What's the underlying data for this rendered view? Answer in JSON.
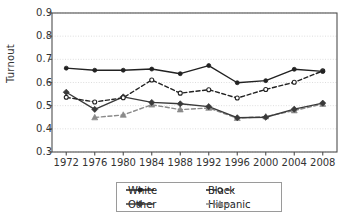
{
  "chart_data": {
    "type": "line",
    "title": "",
    "xlabel": "",
    "ylabel": "Turnout",
    "x": [
      1972,
      1976,
      1980,
      1984,
      1988,
      1992,
      1996,
      2000,
      2004,
      2008
    ],
    "xtick_labels": [
      "1972",
      "1976",
      "1980",
      "1984",
      "1988",
      "1992",
      "1996",
      "2000",
      "2004",
      "2008"
    ],
    "ytick_labels": [
      "0.9",
      "0.8",
      "0.7",
      "0.6",
      "0.5",
      "0.4",
      "0.3"
    ],
    "ytick_values": [
      0.9,
      0.8,
      0.7,
      0.6,
      0.5,
      0.4,
      0.3
    ],
    "ylim": [
      0.3,
      0.9
    ],
    "xlim": [
      1970,
      2010
    ],
    "grid": true,
    "legend_position": "below-center",
    "series": [
      {
        "name": "White",
        "marker": "filled-circle",
        "line_style": "solid",
        "color": "#222222",
        "values": [
          0.662,
          0.653,
          0.653,
          0.658,
          0.638,
          0.673,
          0.599,
          0.608,
          0.657,
          0.648
        ]
      },
      {
        "name": "Black",
        "marker": "open-circle",
        "line_style": "dashed",
        "color": "#222222",
        "values": [
          0.536,
          0.516,
          0.534,
          0.611,
          0.554,
          0.569,
          0.533,
          0.57,
          0.601,
          0.65
        ]
      },
      {
        "name": "Other",
        "marker": "filled-diamond",
        "line_style": "solid",
        "color": "#3a3a3a",
        "values": [
          0.558,
          0.484,
          0.538,
          0.514,
          0.508,
          0.496,
          0.448,
          0.45,
          0.485,
          0.511
        ]
      },
      {
        "name": "Hispanic",
        "marker": "filled-triangle",
        "line_style": "dashed",
        "color": "#8a8a8a",
        "values": [
          null,
          0.449,
          0.46,
          0.504,
          0.483,
          0.49,
          0.446,
          0.453,
          0.479,
          0.507
        ]
      }
    ]
  },
  "legend": {
    "entries": [
      {
        "label": "White"
      },
      {
        "label": "Black"
      },
      {
        "label": "Other"
      },
      {
        "label": "Hispanic"
      }
    ]
  },
  "axes": {
    "y_title": "Turnout"
  },
  "colors": {
    "frame": "#4f4f4f",
    "grid": "#cfcfcf",
    "white_series": "#222222",
    "black_series": "#222222",
    "other_series": "#3a3a3a",
    "hispanic_series": "#8a8a8a",
    "background": "#ffffff"
  }
}
